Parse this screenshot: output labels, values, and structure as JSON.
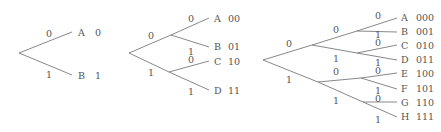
{
  "trees": [
    {
      "name": "tree-1-bit",
      "leaves": [
        {
          "symbol": "A",
          "code": "0"
        },
        {
          "symbol": "B",
          "code": "1"
        }
      ],
      "edge_labels": {
        "upper": "0",
        "lower": "1"
      }
    },
    {
      "name": "tree-2-bit",
      "leaves": [
        {
          "symbol": "A",
          "code": "00"
        },
        {
          "symbol": "B",
          "code": "01"
        },
        {
          "symbol": "C",
          "code": "10"
        },
        {
          "symbol": "D",
          "code": "11"
        }
      ],
      "edge_labels": {
        "upper": "0",
        "lower": "1"
      }
    },
    {
      "name": "tree-3-bit",
      "leaves": [
        {
          "symbol": "A",
          "code": "000"
        },
        {
          "symbol": "B",
          "code": "001"
        },
        {
          "symbol": "C",
          "code": "010"
        },
        {
          "symbol": "D",
          "code": "011"
        },
        {
          "symbol": "E",
          "code": "100"
        },
        {
          "symbol": "F",
          "code": "101"
        },
        {
          "symbol": "G",
          "code": "110"
        },
        {
          "symbol": "H",
          "code": "111"
        }
      ],
      "edge_labels": {
        "upper": "0",
        "lower": "1"
      }
    }
  ],
  "colors": {
    "line": "#7a7a7a",
    "text": "#555555",
    "background": "#ffffff"
  }
}
